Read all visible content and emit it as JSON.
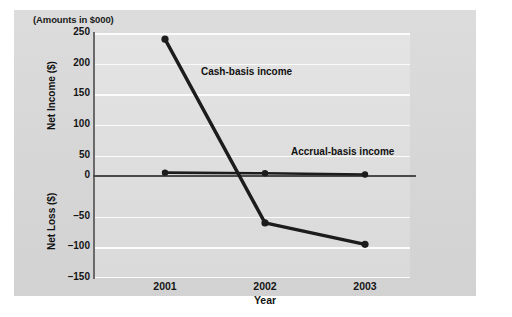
{
  "chart_data": {
    "type": "line",
    "title": "(Amounts in $000)",
    "xlabel": "Year",
    "ylabel": "Net Income ($) / Net Loss ($)",
    "ylabel_upper": "Net Income ($)",
    "ylabel_lower": "Net Loss ($)",
    "categories": [
      "2001",
      "2002",
      "2003"
    ],
    "x": [
      2001,
      2002,
      2003
    ],
    "ylim": [
      -150,
      250
    ],
    "yticks": [
      250,
      200,
      150,
      100,
      50,
      0,
      -50,
      -100,
      -150
    ],
    "ytick_labels": [
      "250",
      "200",
      "150",
      "100",
      "50",
      "0",
      "–50",
      "–100",
      "–150"
    ],
    "xtick_labels": [
      "2001",
      "2002",
      "2003"
    ],
    "grid": true,
    "grid_axis": "y",
    "legend": "inline-annotations",
    "zero_line": 0,
    "series": [
      {
        "name": "Cash-basis income",
        "values": [
          240,
          -60,
          -95
        ],
        "color": "#1c1c1c",
        "marker": "circle",
        "annotation": "Cash-basis income"
      },
      {
        "name": "Accrual-basis income",
        "values": [
          22,
          21,
          19
        ],
        "color": "#1c1c1c",
        "marker": "circle",
        "annotation": "Accrual-basis income"
      }
    ],
    "annotations": [
      {
        "text": "Cash-basis income",
        "x": 2001.35,
        "y": 172
      },
      {
        "text": "Accrual-basis income",
        "x": 2002.3,
        "y": 48
      }
    ],
    "colors": {
      "page_background": "#ffffff",
      "panel_background": "#d8d8d8",
      "plot_background": "#e2e2e2",
      "gridline": "#fbfbfb",
      "axis": "#6a6a6a",
      "zero_line": "#4a4a4a",
      "series_line": "#1c1c1c",
      "text": "#151515"
    }
  }
}
